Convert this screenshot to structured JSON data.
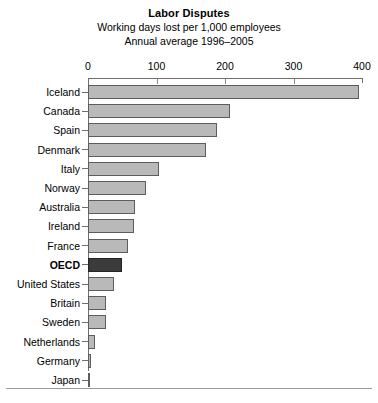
{
  "chart_data": {
    "type": "bar",
    "orientation": "horizontal",
    "title": "Labor Disputes",
    "subtitle_line1": "Working days lost per 1,000 employees",
    "subtitle_line2": "Annual average 1996–2005",
    "xlabel": "",
    "ylabel": "",
    "xlim": [
      0,
      400
    ],
    "xticks": [
      0,
      100,
      200,
      300,
      400
    ],
    "xtick_labels": [
      "0",
      "100",
      "200",
      "300",
      "400"
    ],
    "grid": false,
    "legend": false,
    "axis_position": "top",
    "bar_color": "#b9b9b9",
    "bar_border_color": "#5d5d5d",
    "highlight_color": "#3b3b3b",
    "highlight_category": "OECD",
    "categories": [
      "Iceland",
      "Canada",
      "Spain",
      "Denmark",
      "Italy",
      "Norway",
      "Australia",
      "Ireland",
      "France",
      "OECD",
      "United States",
      "Britain",
      "Sweden",
      "Netherlands",
      "Germany",
      "Japan"
    ],
    "values": [
      395,
      208,
      189,
      172,
      104,
      85,
      69,
      67,
      58,
      50,
      38,
      26,
      27,
      10,
      4,
      3
    ]
  },
  "rows": [
    {
      "label": "Iceland",
      "value": 395,
      "highlight": false
    },
    {
      "label": "Canada",
      "value": 208,
      "highlight": false
    },
    {
      "label": "Spain",
      "value": 189,
      "highlight": false
    },
    {
      "label": "Denmark",
      "value": 172,
      "highlight": false
    },
    {
      "label": "Italy",
      "value": 104,
      "highlight": false
    },
    {
      "label": "Norway",
      "value": 85,
      "highlight": false
    },
    {
      "label": "Australia",
      "value": 69,
      "highlight": false
    },
    {
      "label": "Ireland",
      "value": 67,
      "highlight": false
    },
    {
      "label": "France",
      "value": 58,
      "highlight": false
    },
    {
      "label": "OECD",
      "value": 50,
      "highlight": true
    },
    {
      "label": "United States",
      "value": 38,
      "highlight": false
    },
    {
      "label": "Britain",
      "value": 26,
      "highlight": false
    },
    {
      "label": "Sweden",
      "value": 27,
      "highlight": false
    },
    {
      "label": "Netherlands",
      "value": 10,
      "highlight": false
    },
    {
      "label": "Germany",
      "value": 4,
      "highlight": false
    },
    {
      "label": "Japan",
      "value": 3,
      "highlight": false
    }
  ]
}
